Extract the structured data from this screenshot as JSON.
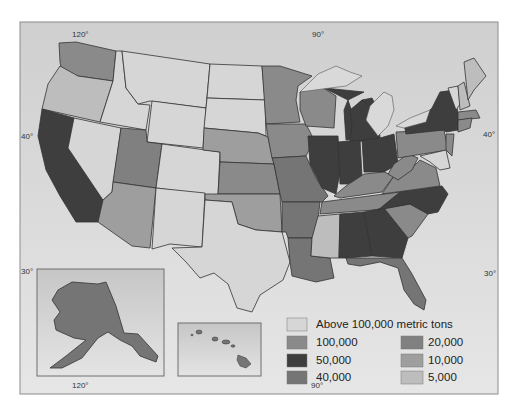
{
  "map": {
    "title": "",
    "graticule": {
      "top_labels": [
        "120°",
        "90°"
      ],
      "bottom_labels": [
        "120°",
        "90°"
      ],
      "left_labels": [
        "40°",
        "30°"
      ],
      "right_labels": [
        "40°",
        "30°"
      ]
    },
    "insets": [
      "Alaska",
      "Hawaii"
    ]
  },
  "legend": {
    "items": [
      {
        "label": "Above 100,000 metric tons",
        "color": "#d6d6d6"
      },
      {
        "label": "100,000",
        "color": "#8a8a8a"
      },
      {
        "label": "50,000",
        "color": "#3e3e3e"
      },
      {
        "label": "40,000",
        "color": "#757575"
      },
      {
        "label": "20,000",
        "color": "#808080"
      },
      {
        "label": "10,000",
        "color": "#9e9e9e"
      },
      {
        "label": "5,000",
        "color": "#bdbdbd"
      }
    ]
  },
  "colors": {
    "background": "#dcdcdc",
    "ocean": "#dedede",
    "frame": "#8c8c8c"
  }
}
